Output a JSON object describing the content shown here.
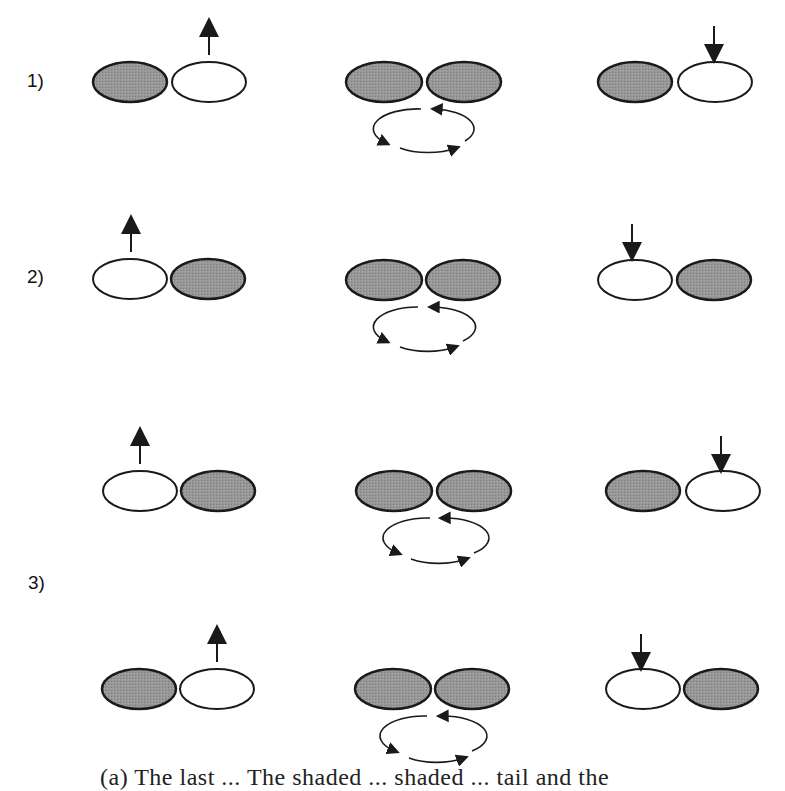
{
  "figure": {
    "row_labels": [
      "1)",
      "2)",
      "3)"
    ],
    "colors": {
      "shaded_lobe": "#8f8f8f",
      "unshaded_lobe": "#ffffff",
      "outline": "#1a1a1a",
      "arrow": "#1a1a1a"
    },
    "panels": [
      {
        "row": "1)",
        "columns": [
          {
            "position": "left",
            "lobes": [
              "shaded",
              "unshaded"
            ],
            "arrow": "up",
            "arrow_on": "right"
          },
          {
            "position": "center",
            "lobes": [
              "shaded",
              "shaded"
            ],
            "rotation": "counterclockwise"
          },
          {
            "position": "right",
            "lobes": [
              "shaded",
              "unshaded"
            ],
            "arrow": "down",
            "arrow_on": "right"
          }
        ]
      },
      {
        "row": "2)",
        "columns": [
          {
            "position": "left",
            "lobes": [
              "unshaded",
              "shaded"
            ],
            "arrow": "up",
            "arrow_on": "left"
          },
          {
            "position": "center",
            "lobes": [
              "shaded",
              "shaded"
            ],
            "rotation": "counterclockwise"
          },
          {
            "position": "right",
            "lobes": [
              "unshaded",
              "shaded"
            ],
            "arrow": "down",
            "arrow_on": "left"
          }
        ]
      },
      {
        "row": "3)",
        "sub": "a",
        "columns": [
          {
            "position": "left",
            "lobes": [
              "unshaded",
              "shaded"
            ],
            "arrow": "up",
            "arrow_on": "left"
          },
          {
            "position": "center",
            "lobes": [
              "shaded",
              "shaded"
            ],
            "rotation": "counterclockwise"
          },
          {
            "position": "right",
            "lobes": [
              "shaded",
              "unshaded"
            ],
            "arrow": "down",
            "arrow_on": "right"
          }
        ]
      },
      {
        "row": "3)",
        "sub": "b",
        "columns": [
          {
            "position": "left",
            "lobes": [
              "shaded",
              "unshaded"
            ],
            "arrow": "up",
            "arrow_on": "right"
          },
          {
            "position": "center",
            "lobes": [
              "shaded",
              "shaded"
            ],
            "rotation": "counterclockwise"
          },
          {
            "position": "right",
            "lobes": [
              "unshaded",
              "shaded"
            ],
            "arrow": "down",
            "arrow_on": "left"
          }
        ]
      }
    ],
    "caption_partial": "(a) The last ...          The shaded ... shaded ... tail and the"
  }
}
